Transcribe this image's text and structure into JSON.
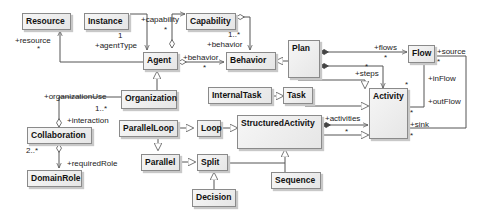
{
  "diagram": {
    "type": "UML class diagram",
    "classes": {
      "resource": "Resource",
      "instance": "Instance",
      "capability": "Capability",
      "agent": "Agent",
      "behavior": "Behavior",
      "plan": "Plan",
      "flow": "Flow",
      "organization": "Organization",
      "internal_task": "InternalTask",
      "task": "Task",
      "activity": "Activity",
      "collaboration": "Collaboration",
      "parallel_loop": "ParallelLoop",
      "loop": "Loop",
      "structured_activity": "StructuredActivity",
      "parallel": "Parallel",
      "split": "Split",
      "sequence": "Sequence",
      "decision": "Decision",
      "domain_role": "DomainRole"
    },
    "labels": {
      "resource_role": "+resource",
      "resource_mult": "*",
      "capability_role": "+capability",
      "capability_mult": "*",
      "agent_type_role": "+agentType",
      "agent_type_mult": "1",
      "cap_behavior_role": "+behavior",
      "cap_behavior_mult": "1..*",
      "agent_behavior_role": "+behavior",
      "agent_behavior_mult": "*",
      "flows_role": "+flows",
      "flows_mult": "*",
      "steps_role": "+steps",
      "steps_mult": "*",
      "source_role": "+source",
      "source_mult": "*",
      "inflow_role": "+inFlow",
      "outflow_role": "+outFlow",
      "sink_role": "+sink",
      "activity_mult_top": "*",
      "activity_mult_out": "*",
      "activity_mult_sink": "*",
      "org_use_role": "+organizationUse",
      "org_use_mult": "1..*",
      "interaction_role": "+interaction",
      "collab_mult": "2..*",
      "required_role": "+requiredRole",
      "activities_role": "+activities",
      "activities_mult": "*"
    }
  }
}
